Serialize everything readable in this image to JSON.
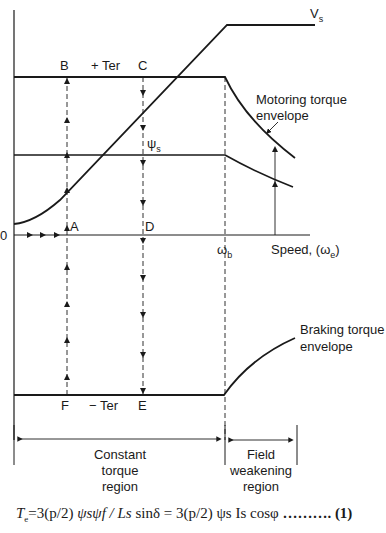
{
  "diagram": {
    "points": {
      "A": "A",
      "B": "B",
      "C": "C",
      "D": "D",
      "E": "E",
      "F": "F"
    },
    "labels": {
      "origin": "0",
      "vs": "V",
      "vs_sub": "s",
      "plus_ter": "+ Ter",
      "minus_ter": "− Ter",
      "psi_s": "ψ",
      "psi_s_sub": "s",
      "omega_b": "ω",
      "omega_b_sub": "b",
      "speed": "Speed, (ω",
      "speed_sub": "e",
      "speed_close": ")",
      "motoring_line1": "Motoring torque",
      "motoring_line2": "envelope",
      "braking_line1": "Braking torque",
      "braking_line2": "envelope",
      "constant_line1": "Constant",
      "constant_line2": "torque",
      "constant_line3": "region",
      "field_line1": "Field",
      "field_line2": "weakening",
      "field_line3": "region"
    },
    "equation": {
      "text_lhs": "T",
      "lhs_sub": "e",
      "part1": "=3(p/2)",
      "part2": " ψsψf / Ls ",
      "part3": "sinδ = 3(p/2) ψs Is cosφ",
      "dots": " ……….",
      "number": "(1)"
    },
    "colors": {
      "ink": "#1a1a1a",
      "background": "#ffffff"
    }
  }
}
